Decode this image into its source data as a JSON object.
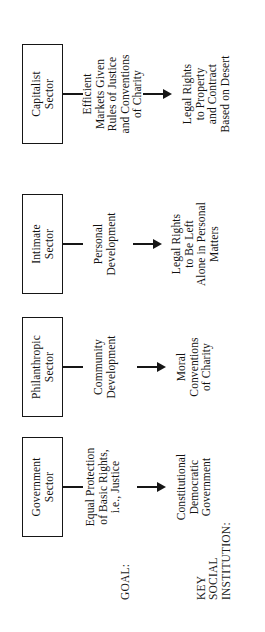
{
  "diagram": {
    "orientation": "rotated-90-ccw",
    "row_labels": {
      "goal": "GOAL:",
      "institution": "KEY\nSOCIAL\nINSTITUTION:"
    },
    "columns": [
      {
        "sector": "Government\nSector",
        "goal": "Equal Protection\nof Basic Rights,\ni.e., Justice",
        "institution": "Constitutional\nDemocratic\nGovernment",
        "arrow": "arrow-down-icon"
      },
      {
        "sector": "Philanthropic\nSector",
        "goal": "Community\nDevelopment",
        "institution": "Moral\nConventions\nof Charity",
        "arrow": "arrow-down-icon"
      },
      {
        "sector": "Intimate\nSector",
        "goal": "Personal\nDevelopment",
        "institution": "Legal Rights\nto Be Left\nAlone in Personal\nMatters",
        "arrow": "arrow-down-icon"
      },
      {
        "sector": "Capitalist\nSector",
        "goal": "Efficient\nMarkets Given\nRules of Justice\nand Conventions\nof Charity",
        "institution": "Legal Rights\nto Property\nand Contract\nBased on Desert",
        "arrow": "arrow-down-icon"
      }
    ]
  }
}
